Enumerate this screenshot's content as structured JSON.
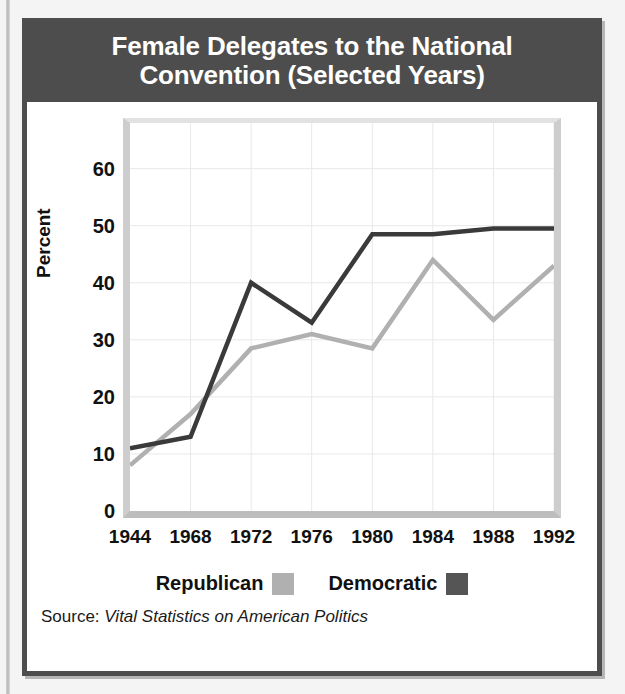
{
  "figure": {
    "title": "Female Delegates to the National Convention (Selected Years)",
    "title_line1": "Female Delegates to the National",
    "title_line2": "Convention (Selected Years)",
    "source_prefix": "Source:",
    "source_title": "Vital Statistics on American Politics"
  },
  "colors": {
    "title_bar": "#4d4d4d",
    "frame": "#4d4d4d",
    "democratic": "#3a3a3a",
    "republican": "#b0b0b0",
    "grid": "#e8e8e8",
    "plot_background": "#ffffff",
    "page_background": "#f4f4f4"
  },
  "legend": {
    "items": [
      {
        "label": "Republican",
        "color": "#b0b0b0"
      },
      {
        "label": "Democratic",
        "color": "#555555"
      }
    ]
  },
  "chart_data": {
    "type": "line",
    "title": "Female Delegates to the National Convention (Selected Years)",
    "xlabel": "",
    "ylabel": "Percent",
    "x": [
      "1944",
      "1968",
      "1972",
      "1976",
      "1980",
      "1984",
      "1988",
      "1992"
    ],
    "categories": [
      "1944",
      "1968",
      "1972",
      "1976",
      "1980",
      "1984",
      "1988",
      "1992"
    ],
    "xtick_labels": [
      "1944",
      "1968",
      "1972",
      "1976",
      "1980",
      "1984",
      "1988",
      "1992"
    ],
    "ytick_labels": [
      "0",
      "10",
      "20",
      "30",
      "40",
      "50",
      "60"
    ],
    "ytick_values": [
      0,
      10,
      20,
      30,
      40,
      50,
      60
    ],
    "ylim": [
      0,
      68
    ],
    "grid": true,
    "legend_position": "bottom",
    "series": [
      {
        "name": "Republican",
        "color": "#b0b0b0",
        "values": [
          8,
          17,
          28.5,
          31,
          28.5,
          44,
          33.5,
          43
        ]
      },
      {
        "name": "Democratic",
        "color": "#3a3a3a",
        "values": [
          11,
          13,
          40,
          33,
          48.5,
          48.5,
          49.5,
          49.5
        ]
      }
    ]
  }
}
